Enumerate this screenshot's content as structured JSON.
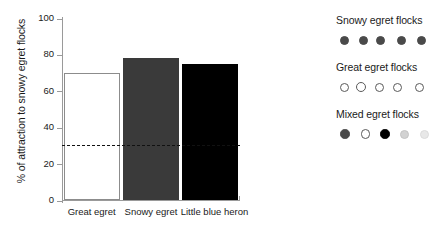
{
  "chart_data": {
    "type": "bar",
    "title": "",
    "xlabel": "",
    "ylabel": "% of attraction to snowy egret flocks",
    "categories": [
      "Great egret",
      "Snowy egret",
      "Little blue heron"
    ],
    "values": [
      70,
      78,
      75
    ],
    "bar_colors": [
      "#ffffff",
      "#3a3a3a",
      "#000000"
    ],
    "ylim": [
      0,
      100
    ],
    "yticks": [
      0,
      20,
      40,
      60,
      80,
      100
    ],
    "ytick_labels": [
      "0",
      "20",
      "40",
      "60",
      "80",
      "100"
    ],
    "grid": false,
    "legend_position": "right",
    "annotations": [
      {
        "type": "reference-line",
        "style": "dashed",
        "value": 31,
        "color": "#111111"
      }
    ]
  },
  "legend": {
    "groups": [
      {
        "title": "Snowy egret flocks",
        "dots": [
          {
            "name": "dot-dark-gray",
            "fill": "#4a4a4a",
            "stroke": "#4a4a4a"
          },
          {
            "name": "dot-dark-gray",
            "fill": "#4a4a4a",
            "stroke": "#4a4a4a"
          },
          {
            "name": "dot-dark-gray",
            "fill": "#4a4a4a",
            "stroke": "#4a4a4a"
          },
          {
            "name": "dot-dark-gray",
            "fill": "#4a4a4a",
            "stroke": "#4a4a4a"
          },
          {
            "name": "dot-dark-gray",
            "fill": "#4a4a4a",
            "stroke": "#4a4a4a"
          }
        ]
      },
      {
        "title": "Great egret flocks",
        "dots": [
          {
            "name": "dot-white-outline",
            "fill": "#ffffff",
            "stroke": "#5a5a5a"
          },
          {
            "name": "dot-white-outline",
            "fill": "#ffffff",
            "stroke": "#5a5a5a"
          },
          {
            "name": "dot-white-outline",
            "fill": "#ffffff",
            "stroke": "#5a5a5a"
          },
          {
            "name": "dot-white-outline",
            "fill": "#ffffff",
            "stroke": "#5a5a5a"
          },
          {
            "name": "dot-white-outline",
            "fill": "#ffffff",
            "stroke": "#5a5a5a"
          }
        ]
      },
      {
        "title": "Mixed egret flocks",
        "dots": [
          {
            "name": "dot-dark-gray",
            "fill": "#4a4a4a",
            "stroke": "#4a4a4a"
          },
          {
            "name": "dot-white-outline",
            "fill": "#ffffff",
            "stroke": "#5a5a5a"
          },
          {
            "name": "dot-black",
            "fill": "#000000",
            "stroke": "#000000"
          },
          {
            "name": "dot-light-gray",
            "fill": "#d2d2d2",
            "stroke": "#c4c4c4"
          },
          {
            "name": "dot-pale-gray",
            "fill": "#e8e8e8",
            "stroke": "#dcdcdc"
          }
        ]
      }
    ]
  }
}
